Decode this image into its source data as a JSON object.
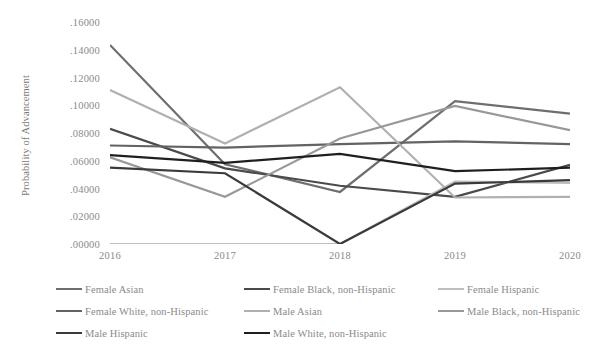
{
  "chart_data": {
    "type": "line",
    "title": "",
    "xlabel": "",
    "ylabel": "Probability of Advancement",
    "x": [
      2016,
      2017,
      2018,
      2019,
      2020
    ],
    "categories": [
      "2016",
      "2017",
      "2018",
      "2019",
      "2020"
    ],
    "ylim": [
      0.0,
      0.16
    ],
    "xlim": [
      2016,
      2020
    ],
    "ytick_labels": [
      ".00000",
      ".02000",
      ".04000",
      ".06000",
      ".08000",
      ".10000",
      ".12000",
      ".14000",
      ".16000"
    ],
    "ytick_values": [
      0.0,
      0.02,
      0.04,
      0.06,
      0.08,
      0.1,
      0.12,
      0.14,
      0.16
    ],
    "xtick_labels": [
      "2016",
      "2017",
      "2018",
      "2019",
      "2020"
    ],
    "grid": false,
    "legend_position": "bottom",
    "series": [
      {
        "name": "Female Asian",
        "color": "#6e6e6e",
        "values": [
          0.1435,
          0.0575,
          0.0375,
          0.103,
          0.094
        ]
      },
      {
        "name": "Female Black, non-Hispanic",
        "color": "#4a4a4a",
        "values": [
          0.083,
          0.0545,
          0.042,
          0.034,
          0.057
        ]
      },
      {
        "name": "Female Hispanic",
        "color": "#bdbdbd",
        "values": [
          0.0,
          0.0,
          0.0,
          0.045,
          0.044
        ]
      },
      {
        "name": "Female White, non-Hispanic",
        "color": "#636363",
        "values": [
          0.071,
          0.0695,
          0.072,
          0.074,
          0.072
        ]
      },
      {
        "name": "Male Asian",
        "color": "#b0b0b0",
        "values": [
          0.111,
          0.0725,
          0.113,
          0.0335,
          0.034
        ]
      },
      {
        "name": "Male Black, non-Hispanic",
        "color": "#989898",
        "values": [
          0.0625,
          0.034,
          0.076,
          0.0995,
          0.082
        ]
      },
      {
        "name": "Male Hispanic",
        "color": "#3a3a3a",
        "values": [
          0.055,
          0.051,
          0.0,
          0.0435,
          0.046
        ]
      },
      {
        "name": "Male White, non-Hispanic",
        "color": "#1f1f1f",
        "values": [
          0.064,
          0.0585,
          0.065,
          0.0525,
          0.055
        ]
      }
    ]
  },
  "legend": {
    "rows": [
      [
        {
          "label": "Female Asian",
          "series": 0,
          "x": 28
        },
        {
          "label": "Female Black, non-Hispanic",
          "series": 1,
          "x": 216
        },
        {
          "label": "Female Hispanic",
          "series": 2,
          "x": 410
        }
      ],
      [
        {
          "label": "Female White, non-Hispanic",
          "series": 3,
          "x": 28
        },
        {
          "label": "Male Asian",
          "series": 4,
          "x": 216
        },
        {
          "label": "Male Black, non-Hispanic",
          "series": 5,
          "x": 410
        }
      ],
      [
        {
          "label": "Male Hispanic",
          "series": 6,
          "x": 28
        },
        {
          "label": "Male White, non-Hispanic",
          "series": 7,
          "x": 216
        }
      ]
    ]
  }
}
